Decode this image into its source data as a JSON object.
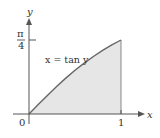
{
  "chart_data": {
    "type": "area",
    "title": "",
    "curve_label": "x = tan y",
    "xlabel": "x",
    "ylabel": "y",
    "x_ticks": [
      {
        "value": 0,
        "label": "0"
      },
      {
        "value": 1,
        "label": "1"
      }
    ],
    "y_ticks": [
      {
        "value": 0.7854,
        "label_num": "π",
        "label_den": "4"
      }
    ],
    "xlim": [
      0,
      1
    ],
    "ylim": [
      0,
      0.7854
    ],
    "x": [
      0,
      0.1,
      0.2,
      0.3,
      0.4,
      0.5,
      0.6,
      0.7,
      0.8,
      0.9,
      1.0
    ],
    "y": [
      0,
      0.0997,
      0.1974,
      0.2915,
      0.3805,
      0.4636,
      0.5404,
      0.6107,
      0.6747,
      0.7328,
      0.7854
    ],
    "shaded_region": "area under curve y = arctan x from x = 0 to x = 1",
    "grid": false,
    "colors": {
      "fill": "#e6e6e6",
      "curve": "#666666",
      "axis": "#555555"
    }
  }
}
